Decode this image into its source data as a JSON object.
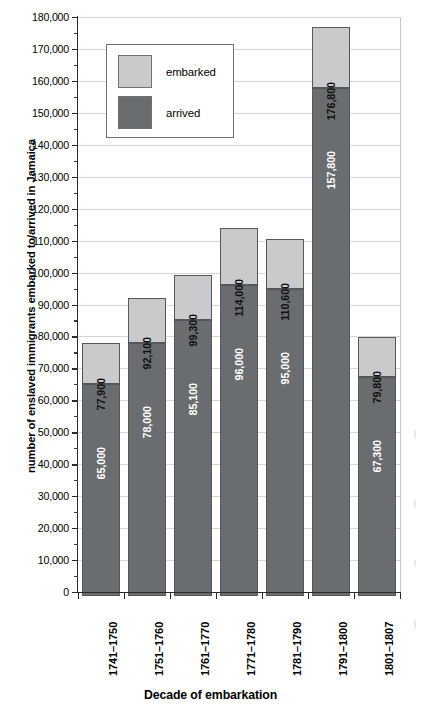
{
  "chart_data": {
    "type": "bar",
    "subtype": "stacked-bar",
    "title": "",
    "xlabel": "Decade of embarkation",
    "ylabel": "number of enslaved immigrants embarked to/arrived in Jamaica",
    "categories": [
      "1741–1750",
      "1751–1760",
      "1761–1770",
      "1771–1780",
      "1781–1790",
      "1791–1800",
      "1801–1807"
    ],
    "series": [
      {
        "name": "arrived",
        "color": "#6a6d6f",
        "values": [
          65000,
          78000,
          85100,
          96000,
          95000,
          157800,
          67300
        ],
        "value_labels": [
          "65,000",
          "78,000",
          "85,100",
          "96,000",
          "95,000",
          "157,800",
          "67,300"
        ]
      },
      {
        "name": "embarked",
        "color": "#c9cacb",
        "values": [
          77900,
          92100,
          99300,
          114000,
          110600,
          176800,
          79800
        ],
        "value_labels": [
          "77,900",
          "92,100",
          "99,300",
          "114,000",
          "110,600",
          "176,800",
          "79,800"
        ]
      }
    ],
    "ylim": [
      0,
      180000
    ],
    "ytick_step": 10000,
    "yminor_step": 5000,
    "ytick_labels": [
      "0",
      "10,000",
      "20,000",
      "30,000",
      "40,000",
      "50,000",
      "60,000",
      "70,000",
      "80,000",
      "90,000",
      "100,000",
      "110,000",
      "120,000",
      "130,000",
      "140,000",
      "150,000",
      "160,000",
      "170,000",
      "180,000"
    ],
    "grid": true,
    "legend_position": "upper-left-inside",
    "legend": [
      {
        "label": "embarked",
        "color": "#c9cacb"
      },
      {
        "label": "arrived",
        "color": "#6a6d6f"
      }
    ],
    "note": "Each bar is stacked: the dark 'arrived' segment runs from 0 to the arrived value; the light 'embarked' segment runs from the arrived value up to the embarked total."
  }
}
